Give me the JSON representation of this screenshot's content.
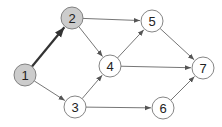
{
  "diagram": {
    "type": "directed-graph",
    "colors": {
      "edge": "#666666",
      "edge_highlight": "#333333",
      "node_fill": "#ffffff",
      "node_fill_highlight": "#cccccc",
      "node_stroke": "#777777"
    },
    "nodes": [
      {
        "id": "1",
        "label": "1",
        "x": 25,
        "y": 75,
        "highlighted": true
      },
      {
        "id": "2",
        "label": "2",
        "x": 72,
        "y": 18,
        "highlighted": true
      },
      {
        "id": "3",
        "label": "3",
        "x": 75,
        "y": 107,
        "highlighted": false
      },
      {
        "id": "4",
        "label": "4",
        "x": 110,
        "y": 66,
        "highlighted": false
      },
      {
        "id": "5",
        "label": "5",
        "x": 152,
        "y": 21,
        "highlighted": false
      },
      {
        "id": "6",
        "label": "6",
        "x": 163,
        "y": 108,
        "highlighted": false
      },
      {
        "id": "7",
        "label": "7",
        "x": 203,
        "y": 68,
        "highlighted": false
      }
    ],
    "edges": [
      {
        "from": "1",
        "to": "2",
        "highlighted": true
      },
      {
        "from": "1",
        "to": "3",
        "highlighted": false
      },
      {
        "from": "2",
        "to": "5",
        "highlighted": false
      },
      {
        "from": "2",
        "to": "4",
        "highlighted": false
      },
      {
        "from": "3",
        "to": "4",
        "highlighted": false
      },
      {
        "from": "3",
        "to": "6",
        "highlighted": false
      },
      {
        "from": "4",
        "to": "5",
        "highlighted": false
      },
      {
        "from": "4",
        "to": "7",
        "highlighted": false
      },
      {
        "from": "5",
        "to": "7",
        "highlighted": false
      },
      {
        "from": "6",
        "to": "7",
        "highlighted": false
      }
    ]
  }
}
